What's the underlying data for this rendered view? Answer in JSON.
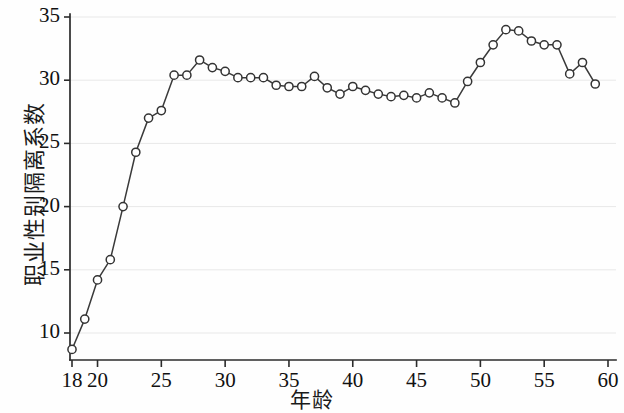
{
  "chart_data": {
    "type": "line",
    "title": "",
    "xlabel": "年龄",
    "ylabel": "职业性别隔离系数",
    "xlim": [
      17.5,
      60
    ],
    "ylim": [
      7.5,
      35.7
    ],
    "xticks": [
      18,
      20,
      25,
      30,
      35,
      40,
      45,
      50,
      55,
      60
    ],
    "xtick_labels": [
      "18",
      "20",
      "25",
      "30",
      "35",
      "40",
      "45",
      "50",
      "55",
      "60"
    ],
    "yticks": [
      10,
      15,
      20,
      25,
      30,
      35
    ],
    "ytick_labels": [
      "10",
      "15",
      "20",
      "25",
      "30",
      "35"
    ],
    "grid": "horizontal",
    "legend": null,
    "marker": "open-circle",
    "line_color": "#3a3a3a",
    "marker_face_color": "#ffffff",
    "marker_edge_color": "#333333",
    "grid_color": "#e8e8e8",
    "axis_color": "#2b2b2b",
    "x": [
      18,
      19,
      20,
      21,
      22,
      23,
      24,
      25,
      26,
      27,
      28,
      29,
      30,
      31,
      32,
      33,
      34,
      35,
      36,
      37,
      38,
      39,
      40,
      41,
      42,
      43,
      44,
      45,
      46,
      47,
      48,
      49,
      50,
      51,
      52,
      53,
      54,
      55,
      56,
      57,
      58,
      59
    ],
    "values": [
      8.7,
      11.1,
      14.2,
      15.8,
      20.0,
      24.3,
      27.0,
      27.6,
      30.4,
      30.4,
      31.6,
      31.0,
      30.7,
      30.2,
      30.2,
      30.2,
      29.6,
      29.5,
      29.5,
      30.3,
      29.4,
      28.9,
      29.5,
      29.2,
      28.9,
      28.7,
      28.8,
      28.6,
      29.0,
      28.6,
      28.2,
      29.9,
      31.4,
      32.8,
      34.0,
      33.9,
      33.1,
      32.8,
      32.8,
      30.5,
      31.4,
      29.7
    ],
    "series": [
      {
        "name": "职业性别隔离系数",
        "values": [
          8.7,
          11.1,
          14.2,
          15.8,
          20.0,
          24.3,
          27.0,
          27.6,
          30.4,
          30.4,
          31.6,
          31.0,
          30.7,
          30.2,
          30.2,
          30.2,
          29.6,
          29.5,
          29.5,
          30.3,
          29.4,
          28.9,
          29.5,
          29.2,
          28.9,
          28.7,
          28.8,
          28.6,
          29.0,
          28.6,
          28.2,
          29.9,
          31.4,
          32.8,
          34.0,
          33.9,
          33.1,
          32.8,
          32.8,
          30.5,
          31.4,
          29.7
        ]
      }
    ]
  }
}
